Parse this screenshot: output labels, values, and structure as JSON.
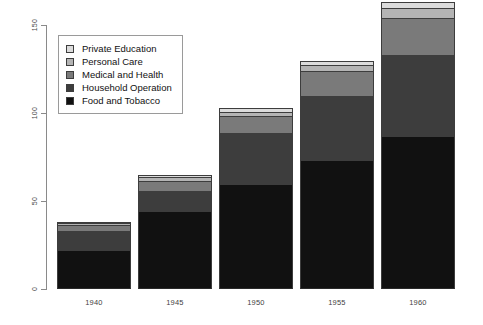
{
  "chart_data": {
    "type": "bar",
    "subtype": "stacked-bar",
    "title": "",
    "xlabel": "",
    "ylabel": "",
    "categories": [
      "1940",
      "1945",
      "1950",
      "1955",
      "1960"
    ],
    "ylim": [
      0,
      150
    ],
    "yticks": [
      0,
      50,
      100,
      150
    ],
    "ytick_labels": [
      "0",
      "50",
      "100",
      "150"
    ],
    "grid": false,
    "legend_position": "top-left",
    "series": [
      {
        "name": "Food and Tobacco",
        "color": "#111111",
        "values": [
          22.2,
          44.5,
          59.6,
          73.2,
          86.8
        ]
      },
      {
        "name": "Household Operation",
        "color": "#3d3d3d",
        "values": [
          10.5,
          11.3,
          29.0,
          36.5,
          46.2
        ]
      },
      {
        "name": "Medical and Health",
        "color": "#7a7a7a",
        "values": [
          3.5,
          5.8,
          9.6,
          14.0,
          21.1
        ]
      },
      {
        "name": "Personal Care",
        "color": "#b4b4b4",
        "values": [
          1.2,
          1.9,
          2.5,
          3.5,
          5.4
        ]
      },
      {
        "name": "Private Education",
        "color": "#dcdcdc",
        "values": [
          0.8,
          1.3,
          1.9,
          2.6,
          3.6
        ]
      }
    ],
    "totals": [
      38.2,
      64.8,
      102.6,
      129.8,
      163.1
    ]
  },
  "legend": {
    "entries": [
      {
        "label": "Private Education",
        "color": "#dcdcdc"
      },
      {
        "label": "Personal Care",
        "color": "#b4b4b4"
      },
      {
        "label": "Medical and Health",
        "color": "#7a7a7a"
      },
      {
        "label": "Household Operation",
        "color": "#3d3d3d"
      },
      {
        "label": "Food and Tobacco",
        "color": "#111111"
      }
    ]
  },
  "axes": {
    "y_tick_labels": [
      "150",
      "100",
      "50",
      "0"
    ],
    "x_tick_labels": [
      "1940",
      "1945",
      "1950",
      "1955",
      "1960"
    ]
  }
}
